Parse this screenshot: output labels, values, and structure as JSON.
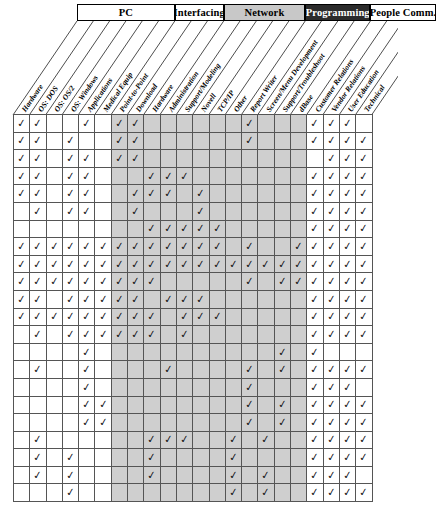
{
  "check_glyph": "✓",
  "colors": {
    "shaded_cell": "#cfcfcf",
    "white_cell": "#ffffff",
    "grid_line": "#555555",
    "group_shade": "#c8c8c8",
    "group_dark": "#2b2b2b",
    "group_dark_text": "#ffffff"
  },
  "chart_data": {
    "type": "heatmap",
    "xlabel": "",
    "ylabel": "",
    "grid": true,
    "legend": "none",
    "groups": [
      {
        "label": "PC",
        "style": "light",
        "span": 6,
        "start_col": 1
      },
      {
        "label": "Interfacing",
        "style": "light",
        "span": 3,
        "start_col": 7
      },
      {
        "label": "Network",
        "style": "shade",
        "span": 5,
        "start_col": 10
      },
      {
        "label": "Programming",
        "style": "dark",
        "span": 4,
        "start_col": 15
      },
      {
        "label": "People Comm.",
        "style": "light",
        "span": 4,
        "start_col": 19
      }
    ],
    "categories": [
      "Hardware",
      "OS: DOS",
      "OS: OS/2",
      "OS: Windows",
      "Applications",
      "Medical Equip",
      "Point-to-Point",
      "Download",
      "Hardware",
      "Administration",
      "Support/Modeling",
      "Novell",
      "TCP/IP",
      "Other",
      "Report Writer",
      "Screen/Menu Development",
      "Support/Troubleshoot",
      "dBase",
      "Customer Relations",
      "Vendor Relations",
      "User Education",
      "Technical"
    ],
    "column_shading": [
      "white",
      "white",
      "white",
      "white",
      "white",
      "white",
      "shade",
      "shade",
      "shade",
      "shade",
      "shade",
      "shade",
      "shade",
      "shade",
      "shade",
      "shade",
      "shade",
      "shade",
      "white",
      "white",
      "white",
      "white"
    ],
    "row_count": 22,
    "values": [
      [
        1,
        1,
        0,
        0,
        1,
        0,
        1,
        1,
        0,
        0,
        0,
        0,
        0,
        0,
        1,
        0,
        0,
        0,
        1,
        1,
        1,
        0
      ],
      [
        1,
        1,
        0,
        1,
        0,
        0,
        1,
        1,
        0,
        0,
        0,
        0,
        0,
        0,
        1,
        0,
        0,
        0,
        1,
        1,
        1,
        1
      ],
      [
        1,
        1,
        0,
        1,
        1,
        0,
        1,
        1,
        0,
        0,
        0,
        0,
        0,
        0,
        0,
        0,
        0,
        0,
        0,
        1,
        1,
        1
      ],
      [
        1,
        1,
        0,
        1,
        1,
        0,
        0,
        0,
        1,
        1,
        1,
        0,
        0,
        0,
        0,
        0,
        0,
        0,
        1,
        1,
        1,
        1
      ],
      [
        1,
        1,
        0,
        1,
        1,
        0,
        0,
        1,
        1,
        1,
        0,
        1,
        0,
        0,
        0,
        0,
        0,
        0,
        1,
        1,
        1,
        1
      ],
      [
        0,
        1,
        0,
        1,
        1,
        0,
        0,
        1,
        0,
        0,
        0,
        1,
        0,
        0,
        0,
        0,
        0,
        0,
        1,
        1,
        1,
        1
      ],
      [
        0,
        0,
        0,
        0,
        0,
        0,
        0,
        0,
        1,
        1,
        1,
        1,
        1,
        0,
        0,
        0,
        0,
        0,
        1,
        1,
        1,
        1
      ],
      [
        1,
        1,
        1,
        1,
        1,
        1,
        1,
        1,
        1,
        1,
        1,
        1,
        1,
        0,
        1,
        0,
        0,
        1,
        1,
        1,
        1,
        1
      ],
      [
        1,
        1,
        1,
        1,
        1,
        1,
        1,
        1,
        1,
        1,
        1,
        1,
        1,
        1,
        1,
        1,
        1,
        1,
        1,
        1,
        1,
        1
      ],
      [
        1,
        1,
        1,
        1,
        1,
        1,
        1,
        1,
        1,
        0,
        0,
        0,
        0,
        0,
        1,
        0,
        1,
        1,
        1,
        1,
        1,
        1
      ],
      [
        1,
        1,
        0,
        1,
        1,
        1,
        1,
        1,
        0,
        1,
        1,
        1,
        0,
        0,
        0,
        0,
        0,
        0,
        1,
        1,
        1,
        1
      ],
      [
        1,
        1,
        1,
        1,
        1,
        1,
        1,
        1,
        1,
        0,
        1,
        1,
        1,
        0,
        0,
        0,
        0,
        0,
        1,
        1,
        1,
        1
      ],
      [
        0,
        1,
        0,
        1,
        1,
        1,
        1,
        1,
        1,
        0,
        1,
        0,
        0,
        0,
        0,
        0,
        0,
        0,
        1,
        1,
        1,
        1
      ],
      [
        0,
        0,
        0,
        0,
        1,
        0,
        0,
        0,
        0,
        0,
        0,
        0,
        0,
        0,
        0,
        0,
        1,
        0,
        1,
        0,
        0,
        0
      ],
      [
        0,
        1,
        0,
        0,
        1,
        0,
        0,
        0,
        0,
        1,
        0,
        0,
        0,
        0,
        1,
        0,
        1,
        0,
        1,
        1,
        1,
        1
      ],
      [
        0,
        0,
        0,
        0,
        1,
        0,
        0,
        0,
        0,
        0,
        0,
        0,
        0,
        0,
        1,
        0,
        0,
        0,
        1,
        1,
        1,
        0
      ],
      [
        0,
        0,
        0,
        0,
        1,
        1,
        0,
        0,
        0,
        0,
        0,
        0,
        0,
        0,
        1,
        0,
        1,
        0,
        1,
        1,
        1,
        1
      ],
      [
        0,
        0,
        0,
        0,
        1,
        1,
        0,
        0,
        0,
        0,
        0,
        0,
        0,
        0,
        1,
        0,
        1,
        0,
        1,
        1,
        1,
        1
      ],
      [
        0,
        1,
        0,
        0,
        0,
        0,
        0,
        0,
        1,
        1,
        1,
        0,
        0,
        1,
        0,
        1,
        0,
        0,
        1,
        1,
        1,
        1
      ],
      [
        0,
        1,
        0,
        1,
        0,
        0,
        0,
        0,
        1,
        0,
        0,
        0,
        0,
        1,
        0,
        0,
        0,
        0,
        1,
        1,
        1,
        1
      ],
      [
        0,
        1,
        0,
        1,
        0,
        0,
        0,
        0,
        1,
        0,
        0,
        0,
        0,
        1,
        0,
        1,
        0,
        0,
        1,
        1,
        1,
        0
      ],
      [
        0,
        0,
        0,
        1,
        0,
        0,
        0,
        0,
        0,
        0,
        0,
        0,
        0,
        1,
        0,
        1,
        0,
        0,
        1,
        1,
        1,
        1
      ]
    ]
  }
}
